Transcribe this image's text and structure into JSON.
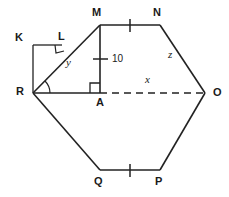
{
  "figure": {
    "kind": "geometry-diagram",
    "shape_name": "hexagon-with-inscribed-right-triangle",
    "stroke_color": "#222222",
    "background_color": "#ffffff",
    "width": 229,
    "height": 197
  },
  "vertices": [
    {
      "name": "M",
      "label": "M",
      "x": 100,
      "y": 25,
      "label_x": 92,
      "label_y": 7
    },
    {
      "name": "N",
      "label": "N",
      "x": 160,
      "y": 25,
      "label_x": 153,
      "label_y": 7
    },
    {
      "name": "O",
      "label": "O",
      "x": 205,
      "y": 93,
      "label_x": 213,
      "label_y": 88
    },
    {
      "name": "P",
      "label": "P",
      "x": 160,
      "y": 170,
      "label_x": 155,
      "label_y": 176
    },
    {
      "name": "Q",
      "label": "Q",
      "x": 100,
      "y": 170,
      "label_x": 94,
      "label_y": 176
    },
    {
      "name": "R",
      "label": "R",
      "x": 33,
      "y": 93,
      "label_x": 16,
      "label_y": 86
    },
    {
      "name": "K",
      "label": "K",
      "x": 33,
      "y": 45,
      "label_x": 15,
      "label_y": 32
    },
    {
      "name": "L",
      "label": "L",
      "x": 62,
      "y": 45,
      "label_x": 60,
      "label_y": 31
    },
    {
      "name": "A",
      "label": "A",
      "x": 100,
      "y": 93,
      "label_x": 96,
      "label_y": 98
    }
  ],
  "segments": [
    {
      "name": "MN",
      "from": "M",
      "to": "N",
      "style": "solid",
      "tick_count": 1
    },
    {
      "name": "NO",
      "from": "N",
      "to": "O",
      "style": "solid",
      "tick_count": 0
    },
    {
      "name": "OP",
      "from": "O",
      "to": "P",
      "style": "solid",
      "tick_count": 0
    },
    {
      "name": "PQ",
      "from": "P",
      "to": "Q",
      "style": "solid",
      "tick_count": 1
    },
    {
      "name": "QR",
      "from": "Q",
      "to": "R",
      "style": "solid",
      "tick_count": 0
    },
    {
      "name": "RM",
      "from": "R",
      "to": "M",
      "style": "solid",
      "tick_count": 0
    },
    {
      "name": "RA",
      "from": "R",
      "to": "A",
      "style": "solid",
      "tick_count": 0
    },
    {
      "name": "AO",
      "from": "A",
      "to": "O",
      "style": "dashed",
      "tick_count": 0
    },
    {
      "name": "MA",
      "from": "M",
      "to": "A",
      "style": "solid",
      "tick_count": 1
    },
    {
      "name": "KL",
      "from": "K",
      "to": "L",
      "style": "solid",
      "tick_count": 0
    },
    {
      "name": "KR",
      "from": "K",
      "to": "R",
      "style": "solid",
      "tick_count": 0
    }
  ],
  "measure_labels": [
    {
      "name": "altitude-length",
      "text": "10",
      "x": 112,
      "y": 60,
      "kind": "number"
    },
    {
      "name": "side-x",
      "text": "x",
      "x": 145,
      "y": 80,
      "kind": "variable"
    },
    {
      "name": "side-y",
      "text": "y",
      "x": 66,
      "y": 63,
      "kind": "variable"
    },
    {
      "name": "side-z",
      "text": "z",
      "x": 168,
      "y": 55,
      "kind": "variable"
    }
  ],
  "angle_marks": [
    {
      "name": "right-angle-at-A",
      "type": "right-angle",
      "vertex": "A"
    },
    {
      "name": "right-angle-at-L",
      "type": "right-angle",
      "vertex": "L"
    },
    {
      "name": "angle-arc-at-R",
      "type": "arc",
      "vertex": "R"
    }
  ]
}
